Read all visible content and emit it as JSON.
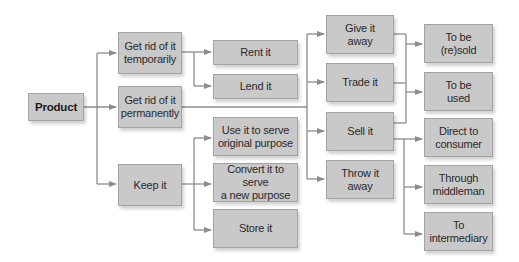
{
  "diagram": {
    "type": "flowchart-tree",
    "colors": {
      "box_fill": "#c9c9c9",
      "box_border": "#a3a3a3",
      "connector": "#8c8c8c",
      "text": "#2a2a2a"
    },
    "nodes": {
      "product": "Product",
      "get_rid_temp": "Get rid of it\ntemporarily",
      "get_rid_perm": "Get rid of it\npermanently",
      "keep_it": "Keep it",
      "rent_it": "Rent it",
      "lend_it": "Lend it",
      "use_original": "Use it to serve\noriginal purpose",
      "convert_new": "Convert it to serve\na new purpose",
      "store_it": "Store it",
      "give_away": "Give it\naway",
      "trade_it": "Trade it",
      "sell_it": "Sell it",
      "throw_away": "Throw it\naway",
      "to_be_resold": "To be\n(re)sold",
      "to_be_used": "To be\nused",
      "direct_consumer": "Direct to\nconsumer",
      "through_middleman": "Through\nmiddleman",
      "to_intermediary": "To\nintermediary"
    },
    "edges": [
      [
        "product",
        "get_rid_temp"
      ],
      [
        "product",
        "get_rid_perm"
      ],
      [
        "product",
        "keep_it"
      ],
      [
        "get_rid_temp",
        "rent_it"
      ],
      [
        "get_rid_temp",
        "lend_it"
      ],
      [
        "get_rid_perm",
        "give_away"
      ],
      [
        "get_rid_perm",
        "trade_it"
      ],
      [
        "get_rid_perm",
        "sell_it"
      ],
      [
        "get_rid_perm",
        "throw_away"
      ],
      [
        "keep_it",
        "use_original"
      ],
      [
        "keep_it",
        "convert_new"
      ],
      [
        "keep_it",
        "store_it"
      ],
      [
        "give_away",
        "to_be_resold"
      ],
      [
        "give_away",
        "to_be_used"
      ],
      [
        "trade_it",
        "to_be_resold"
      ],
      [
        "trade_it",
        "to_be_used"
      ],
      [
        "sell_it",
        "to_be_resold"
      ],
      [
        "sell_it",
        "to_be_used"
      ],
      [
        "sell_it",
        "direct_consumer"
      ],
      [
        "sell_it",
        "through_middleman"
      ],
      [
        "sell_it",
        "to_intermediary"
      ]
    ]
  }
}
